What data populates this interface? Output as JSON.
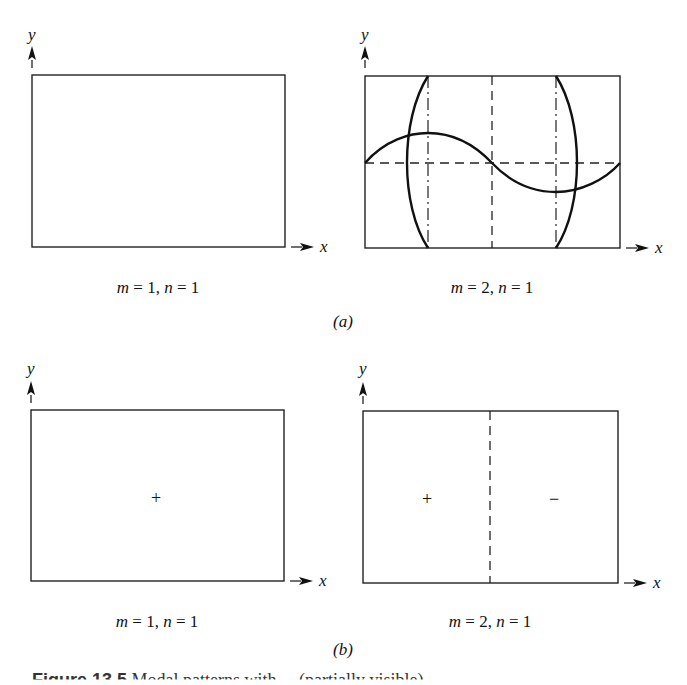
{
  "figure": {
    "parts": [
      {
        "label": "(a)",
        "panels": [
          {
            "caption": "m = 1, n = 1",
            "axis_x": "x",
            "axis_y": "y",
            "signs": []
          },
          {
            "caption": "m = 2, n = 1",
            "axis_x": "x",
            "axis_y": "y",
            "signs": []
          }
        ]
      },
      {
        "label": "(b)",
        "panels": [
          {
            "caption": "m = 1, n = 1",
            "axis_x": "x",
            "axis_y": "y",
            "signs": [
              "+"
            ]
          },
          {
            "caption": "m = 2, n = 1",
            "axis_x": "x",
            "axis_y": "y",
            "signs": [
              "+",
              "−"
            ]
          }
        ]
      }
    ],
    "caption_number": "Figure 13.5",
    "caption_text": "Modal patterns with ... (partially visible)"
  },
  "colors": {
    "line": "#111111",
    "background": "#ffffff"
  }
}
